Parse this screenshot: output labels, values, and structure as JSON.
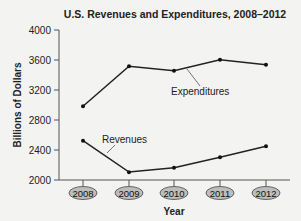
{
  "chart_data": {
    "type": "line",
    "title": "U.S. Revenues and Expenditures, 2008–2012",
    "xlabel": "Year",
    "ylabel": "Billions of Dollars",
    "categories": [
      "2008",
      "2009",
      "2010",
      "2011",
      "2012"
    ],
    "yticks": [
      "4000",
      "3600",
      "3200",
      "2800",
      "2400",
      "2000"
    ],
    "ylim": [
      2000,
      4000
    ],
    "grid": false,
    "legend": "inline annotations",
    "series": [
      {
        "name": "Expenditures",
        "values": [
          2983,
          3518,
          3457,
          3603,
          3537
        ]
      },
      {
        "name": "Revenues",
        "values": [
          2524,
          2105,
          2163,
          2303,
          2450
        ]
      }
    ]
  }
}
